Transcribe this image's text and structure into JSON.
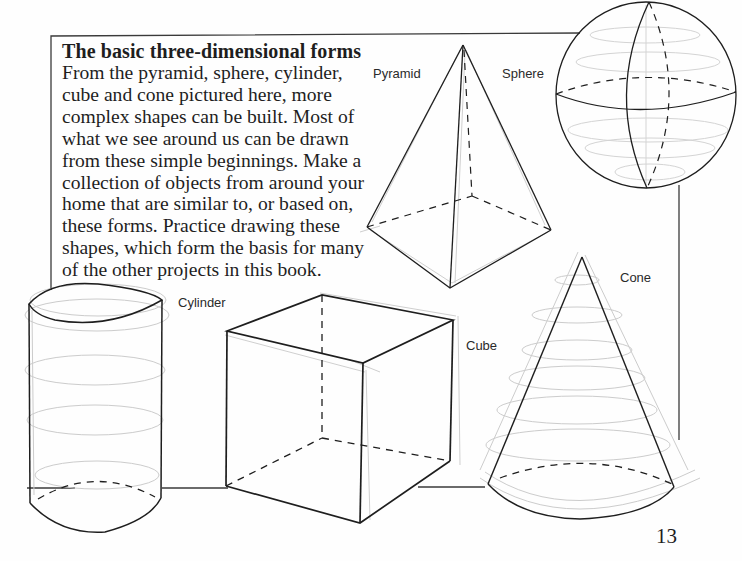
{
  "article": {
    "heading": "The basic three-dimensional forms",
    "body_lines": [
      "From the pyramid, sphere, cylinder,",
      "cube and cone pictured here, more",
      "complex shapes can be built. Most of",
      "what we see around us can be drawn",
      "from these simple beginnings. Make a",
      "collection of objects from around your",
      "home that are similar to, or based on,",
      "these forms. Practice drawing these",
      "shapes, which form the basis for many",
      "of the other projects in this book."
    ]
  },
  "figures": {
    "pyramid": {
      "label": "Pyramid"
    },
    "sphere": {
      "label": "Sphere"
    },
    "cylinder": {
      "label": "Cylinder"
    },
    "cube": {
      "label": "Cube"
    },
    "cone": {
      "label": "Cone"
    }
  },
  "page_number": "13",
  "colors": {
    "ink": "#1e1e1e",
    "sketch": "#c8c8c8",
    "frame": "#3a3a3a"
  }
}
